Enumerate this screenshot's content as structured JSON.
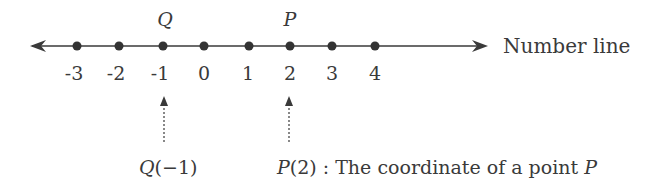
{
  "diagram": {
    "title": "Number line",
    "axis_label": "Number line",
    "ticks": [
      {
        "value": "-3",
        "x": 77
      },
      {
        "value": "-2",
        "x": 119
      },
      {
        "value": "-1",
        "x": 163
      },
      {
        "value": "0",
        "x": 204
      },
      {
        "value": "1",
        "x": 249
      },
      {
        "value": "2",
        "x": 290
      },
      {
        "value": "3",
        "x": 332
      },
      {
        "value": "4",
        "x": 375
      }
    ],
    "points": [
      {
        "name": "Q",
        "value": -1,
        "x": 163
      },
      {
        "name": "P",
        "value": 2,
        "x": 290
      }
    ],
    "annotations": {
      "q": {
        "name": "Q",
        "coord": "(−1)"
      },
      "p": {
        "name": "P",
        "coord": "(2)",
        "description": " : The coordinate of a point ",
        "name_again": "P"
      }
    },
    "colors": {
      "line": "#3a3a3a",
      "text": "#3a3a3a"
    }
  }
}
